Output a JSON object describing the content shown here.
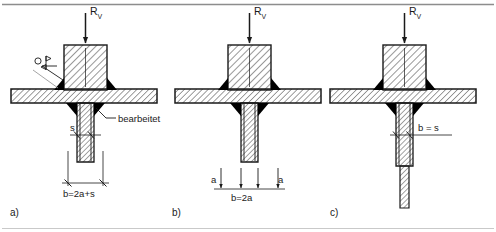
{
  "figure": {
    "type": "engineering-detail-drawing",
    "language": "de",
    "line_color": "#1a1a1a",
    "hatch_color": "#1a1a1a",
    "weld_fill_color": "#000000",
    "background": "#ffffff",
    "border": {
      "top_rule": true,
      "bottom_rule": true
    }
  },
  "panels": [
    {
      "id": "a",
      "caption": "a)",
      "load_label": {
        "symbol": "R",
        "subscript": "V",
        "text": "R"
      },
      "weld_symbol": {
        "name": "field-weld-symbol",
        "has_circle": true,
        "has_flag": true,
        "leader": true
      },
      "annotations": [
        {
          "name": "machined-note",
          "text": "bearbeitet"
        },
        {
          "name": "thickness-dim",
          "text": "s"
        },
        {
          "name": "width-dim",
          "text": "b=2a+s"
        }
      ]
    },
    {
      "id": "b",
      "caption": "b)",
      "load_label": {
        "symbol": "R",
        "subscript": "V",
        "text": "R"
      },
      "annotations": [
        {
          "name": "throat-dim-left",
          "text": "a"
        },
        {
          "name": "throat-dim-right",
          "text": "a"
        },
        {
          "name": "width-dim",
          "text": "b=2a"
        }
      ]
    },
    {
      "id": "c",
      "caption": "c)",
      "load_label": {
        "symbol": "R",
        "subscript": "V",
        "text": "R"
      },
      "annotations": [
        {
          "name": "width-dim",
          "text": "b = s"
        }
      ]
    }
  ]
}
